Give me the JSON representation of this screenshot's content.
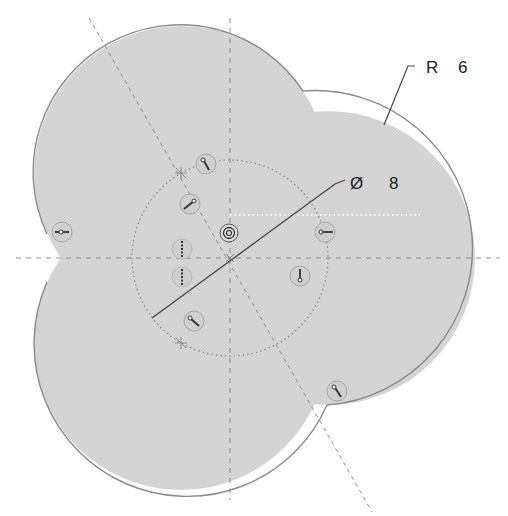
{
  "sketch": {
    "center": {
      "x": 230,
      "y": 258
    },
    "construction_circle": {
      "radius": 98,
      "style": "dotted"
    },
    "lobes": [
      {
        "name": "upper-left",
        "cx": 181,
        "cy": 173,
        "r": 147
      },
      {
        "name": "lower-left",
        "cx": 181,
        "cy": 343,
        "r": 147
      },
      {
        "name": "right",
        "cx": 328,
        "cy": 258,
        "r": 147
      }
    ],
    "colors": {
      "fill": "#d4d4d4",
      "outline": "#8a8a8a",
      "construction": "#8f8f8f",
      "dimension": "#444444",
      "text": "#222222"
    }
  },
  "dimensions": {
    "radius": {
      "symbol": "R",
      "value": "6"
    },
    "diameter": {
      "symbol": "Ø",
      "value": "8"
    }
  },
  "constraints": [
    {
      "type": "coincident",
      "x": 206,
      "y": 164
    },
    {
      "type": "coincident",
      "x": 190,
      "y": 204
    },
    {
      "type": "concentric",
      "x": 229,
      "y": 233
    },
    {
      "type": "vertical",
      "x": 182,
      "y": 249
    },
    {
      "type": "vertical",
      "x": 182,
      "y": 277
    },
    {
      "type": "coincident",
      "x": 194,
      "y": 321
    },
    {
      "type": "horizontal",
      "x": 62,
      "y": 232
    },
    {
      "type": "horizontal",
      "x": 325,
      "y": 232
    },
    {
      "type": "vertical-arrow",
      "x": 300,
      "y": 276
    },
    {
      "type": "coincident",
      "x": 337,
      "y": 391
    }
  ]
}
